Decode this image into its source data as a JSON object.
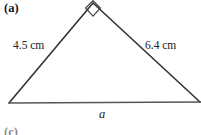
{
  "figure": {
    "part_label": "(a)",
    "next_part_label": "(c)",
    "shape": "right-triangle",
    "background_color": "#ffffff",
    "stroke_color": "#333333",
    "base_stroke_color": "#555555",
    "labels": {
      "left_side": "4.5 cm",
      "right_side": "6.4 cm",
      "base": "a"
    },
    "right_angle_marker": {
      "present": true,
      "at_vertex": "apex"
    },
    "vertices": {
      "apex": {
        "x": 93,
        "y": 3
      },
      "bottom_left": {
        "x": 9,
        "y": 103
      },
      "bottom_right": {
        "x": 200,
        "y": 102
      }
    }
  }
}
